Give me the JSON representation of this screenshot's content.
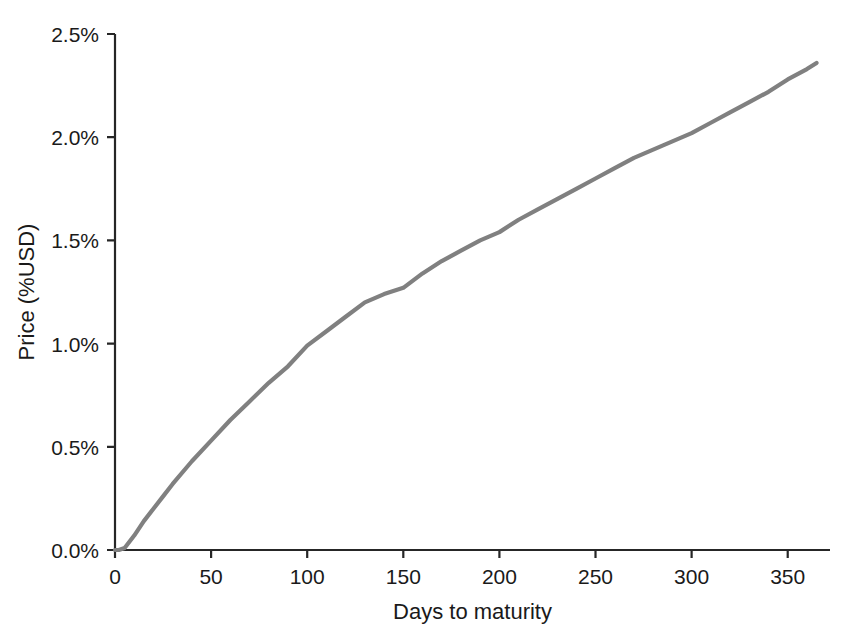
{
  "chart_data": {
    "type": "line",
    "title": "",
    "xlabel": "Days to maturity",
    "ylabel": "Price (%USD)",
    "xlim": [
      0,
      372
    ],
    "ylim": [
      0,
      2.5
    ],
    "grid": false,
    "legend": null,
    "line_color": "#808080",
    "axis_color": "#262626",
    "xticks": [
      0,
      50,
      100,
      150,
      200,
      250,
      300,
      350
    ],
    "xticklabels": [
      "0",
      "50",
      "100",
      "150",
      "200",
      "250",
      "300",
      "350"
    ],
    "yticks": [
      0.0,
      0.5,
      1.0,
      1.5,
      2.0,
      2.5
    ],
    "yticklabels": [
      "0.0%",
      "0.5%",
      "1.0%",
      "1.5%",
      "2.0%",
      "2.5%"
    ],
    "series": [
      {
        "name": "Price",
        "x": [
          0,
          2,
          5,
          10,
          15,
          20,
          25,
          30,
          40,
          50,
          60,
          70,
          80,
          90,
          100,
          110,
          120,
          130,
          140,
          150,
          160,
          170,
          180,
          190,
          200,
          210,
          220,
          230,
          240,
          250,
          260,
          270,
          280,
          290,
          300,
          310,
          320,
          330,
          340,
          350,
          360,
          365
        ],
        "y": [
          0.0,
          0.0,
          0.01,
          0.07,
          0.14,
          0.2,
          0.26,
          0.32,
          0.43,
          0.53,
          0.63,
          0.72,
          0.81,
          0.89,
          0.99,
          1.06,
          1.13,
          1.2,
          1.24,
          1.27,
          1.34,
          1.4,
          1.45,
          1.5,
          1.54,
          1.6,
          1.65,
          1.7,
          1.75,
          1.8,
          1.85,
          1.9,
          1.94,
          1.98,
          2.02,
          2.07,
          2.12,
          2.17,
          2.22,
          2.28,
          2.33,
          2.36
        ]
      }
    ]
  }
}
